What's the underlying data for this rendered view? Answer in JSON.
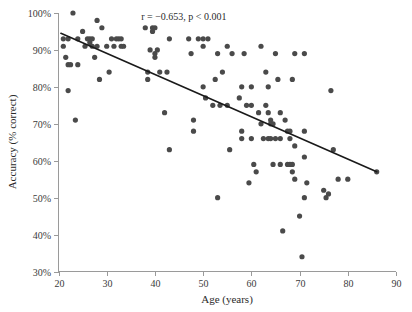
{
  "chart_data": {
    "type": "scatter",
    "title": "",
    "xlabel": "Age (years)",
    "ylabel": "Accuracy (% correct)",
    "xlim": [
      20,
      90
    ],
    "ylim": [
      30,
      100
    ],
    "xticks": [
      20,
      30,
      40,
      50,
      60,
      70,
      80,
      90
    ],
    "xtick_labels": [
      "20",
      "30",
      "40",
      "50",
      "60",
      "70",
      "80",
      "90"
    ],
    "yticks": [
      30,
      40,
      50,
      60,
      70,
      80,
      90,
      100
    ],
    "ytick_labels": [
      "30%",
      "40%",
      "50%",
      "60%",
      "70%",
      "80%",
      "90%",
      "100%"
    ],
    "grid": false,
    "legend": "none",
    "annotation": "r = −0.653, p < 0.001",
    "annotation_x": 46,
    "annotation_y": 98,
    "point_color": "#4a4a4a",
    "point_radius": 2.6,
    "trend_line": {
      "color": "#1a1a1a",
      "x_start": 20.5,
      "y_start": 94.5,
      "x_end": 86.0,
      "y_end": 57.0
    },
    "x": [
      21,
      21,
      21.5,
      22,
      22,
      22,
      22.5,
      23,
      23.5,
      24,
      24,
      25,
      25.5,
      26,
      26.5,
      26.5,
      27,
      27,
      27.5,
      28,
      28,
      28.5,
      29,
      30,
      30.5,
      31,
      31.5,
      32,
      32.5,
      33,
      33,
      33.5,
      38,
      38.5,
      38.5,
      39,
      39.5,
      39.5,
      40,
      40,
      40,
      40.5,
      41,
      42,
      42.5,
      43,
      43,
      47,
      47.5,
      48,
      48,
      49,
      50,
      50,
      50,
      50.5,
      51,
      52,
      52.5,
      53,
      53,
      53.5,
      54,
      55,
      55,
      55.5,
      56,
      57.5,
      58,
      58,
      58,
      58.5,
      59,
      59.5,
      60,
      60,
      60,
      60.5,
      61,
      61.5,
      62,
      62,
      62.5,
      63,
      63,
      63.5,
      63.5,
      63.5,
      64,
      64,
      64,
      64.5,
      64.5,
      65,
      65,
      65.5,
      66,
      66,
      66,
      66.5,
      67,
      67.5,
      67.5,
      68,
      68,
      68,
      68.5,
      68.5,
      68.5,
      69,
      69,
      69,
      70,
      70.5,
      71,
      71,
      71,
      71,
      71.5,
      75,
      75.5,
      76,
      76.5,
      77,
      78,
      80,
      86
    ],
    "y": [
      93,
      91,
      88,
      93,
      86,
      79,
      86,
      100,
      71,
      93,
      86,
      95,
      91,
      93,
      93,
      92,
      93,
      91,
      88,
      98,
      91,
      82,
      96,
      91,
      84,
      93,
      91,
      93,
      93,
      93,
      91,
      91,
      96,
      84,
      82,
      90,
      96,
      95,
      96,
      89,
      88,
      90,
      84,
      73,
      84,
      93,
      63,
      93,
      89,
      71,
      68,
      93,
      93,
      91,
      80,
      77,
      93,
      75,
      82,
      89,
      50,
      75,
      84,
      91,
      75,
      63,
      89,
      77,
      80,
      68,
      66,
      89,
      75,
      54,
      80,
      75,
      66,
      59,
      57,
      73,
      91,
      70,
      66,
      84,
      75,
      80,
      73,
      66,
      71,
      70,
      66,
      59,
      70,
      66,
      89,
      82,
      73,
      66,
      59,
      41,
      71,
      59,
      68,
      68,
      66,
      59,
      82,
      59,
      57,
      55,
      89,
      64,
      45,
      34,
      61,
      50,
      89,
      68,
      54,
      52,
      50,
      51,
      79,
      63,
      55,
      55,
      57,
      70,
      61
    ]
  }
}
